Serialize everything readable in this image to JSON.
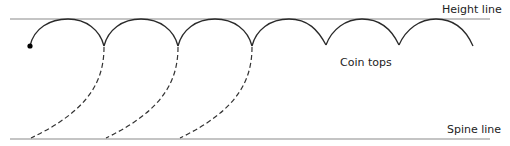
{
  "labels": {
    "height_line": "Height line",
    "coin_tops": "Coin tops",
    "spine_line": "Spine line"
  },
  "colors": {
    "guide_line": "#8a8a8a",
    "arc": "#2a2a2a",
    "dashed": "#333333",
    "dot": "#000000",
    "text": "#222222"
  },
  "diagram": {
    "height_line_y": 19,
    "spine_line_y": 139,
    "start_dot": [
      30,
      46
    ],
    "arc_cusps_x": [
      104,
      178,
      252,
      326,
      399
    ],
    "arc_end": [
      473,
      46
    ],
    "dashed_curves": [
      {
        "from": [
          104,
          46
        ],
        "to": [
          31,
          138
        ]
      },
      {
        "from": [
          178,
          46
        ],
        "to": [
          106,
          138
        ]
      },
      {
        "from": [
          252,
          46
        ],
        "to": [
          180,
          138
        ]
      }
    ]
  }
}
